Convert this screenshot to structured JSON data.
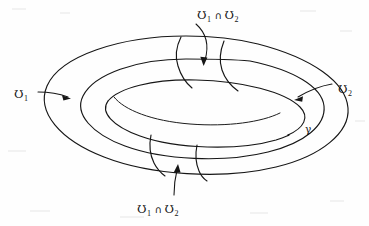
{
  "figure": {
    "name": "torus-open-cover-diagram",
    "background_color": "#fefefe",
    "ink_color": "#161616"
  },
  "labels": {
    "u1": {
      "symbol": "Ʊ",
      "subscript": "1"
    },
    "u2": {
      "symbol": "Ʊ",
      "subscript": "2"
    },
    "intersection_operator": "∩",
    "gamma": "γ",
    "top_intersection": {
      "left_symbol": "Ʊ",
      "left_subscript": "1",
      "operator": "∩",
      "right_symbol": "Ʊ",
      "right_subscript": "2"
    },
    "bottom_intersection": {
      "left_symbol": "Ʊ",
      "left_subscript": "1",
      "operator": "∩",
      "right_symbol": "Ʊ",
      "right_subscript": "2"
    }
  },
  "annotations": [
    {
      "name": "u1-pointer",
      "label": "Ʊ₁",
      "direction": "right"
    },
    {
      "name": "u2-pointer",
      "label": "Ʊ₂",
      "direction": "left"
    },
    {
      "name": "top-intersection-pointer",
      "label": "Ʊ₁ ∩ Ʊ₂",
      "direction": "down"
    },
    {
      "name": "bottom-intersection-pointer",
      "label": "Ʊ₁ ∩ Ʊ₂",
      "direction": "up"
    },
    {
      "name": "gamma-label",
      "label": "γ",
      "direction": "none"
    }
  ]
}
